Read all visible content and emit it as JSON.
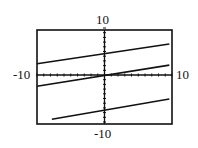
{
  "chart_data": {
    "type": "line",
    "title": "",
    "xlabel": "",
    "ylabel": "",
    "xlim": [
      -10,
      10
    ],
    "ylim": [
      -10,
      10
    ],
    "grid": false,
    "legend": null,
    "axis_labels": {
      "x_min": "-10",
      "x_max": "10",
      "y_min": "-10",
      "y_max": "10"
    },
    "series": [
      {
        "name": "upper line",
        "x": [
          -10,
          9.6
        ],
        "y": [
          2.4,
          6.6
        ]
      },
      {
        "name": "middle line",
        "x": [
          -10,
          9.6
        ],
        "y": [
          -2.4,
          2.1
        ]
      },
      {
        "name": "lower line",
        "x": [
          -7.8,
          9.6
        ],
        "y": [
          -9.4,
          -5.1
        ]
      }
    ]
  }
}
